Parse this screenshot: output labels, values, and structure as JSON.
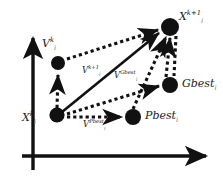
{
  "figure": {
    "background": "#ffffff",
    "ink": "#111111",
    "subscript_color": "#7a7a7a",
    "width": 223,
    "height": 182
  },
  "axes": {
    "x_axis": {
      "name": "horizontal-axis",
      "from": [
        22,
        156
      ],
      "to": [
        212,
        156
      ],
      "arrow": "right"
    },
    "y_axis": {
      "name": "vertical-axis",
      "from": [
        33,
        170
      ],
      "to": [
        33,
        32
      ],
      "arrow": "up"
    }
  },
  "nodes": [
    {
      "id": "Xk",
      "label_main": "X",
      "sup": "k",
      "sub": "i",
      "x": 57,
      "y": 115,
      "r": 7.5,
      "label_x": 24,
      "label_y": 113
    },
    {
      "id": "Vk",
      "label_main": "V",
      "sup": "k",
      "sub": "i",
      "x": 58,
      "y": 63,
      "r": 7.0,
      "label_x": 43,
      "label_y": 40
    },
    {
      "id": "Xk1",
      "label_main": "X",
      "sup": "k+1",
      "sub": "i",
      "x": 170,
      "y": 27,
      "r": 9.0,
      "label_x": 178,
      "label_y": 12
    },
    {
      "id": "Gbest",
      "label_main": "Gbest",
      "sup": "",
      "sub": "i",
      "x": 170,
      "y": 85,
      "r": 8.0,
      "label_x": 182,
      "label_y": 80
    },
    {
      "id": "Pbest",
      "label_main": "Pbest",
      "sup": "",
      "sub": "i",
      "x": 133,
      "y": 117,
      "r": 8.0,
      "label_x": 145,
      "label_y": 112
    }
  ],
  "vector_labels": [
    {
      "id": "v_k1",
      "main": "V",
      "sup": "k+1",
      "sub": "i",
      "x": 83,
      "y": 69
    },
    {
      "id": "v_gbest",
      "main": "V",
      "sup": "Gbest",
      "sub": "i",
      "x": 115,
      "y": 74
    },
    {
      "id": "v_pbest",
      "main": "V",
      "sup": "Pbest",
      "sub": "i",
      "x": 84,
      "y": 122
    }
  ],
  "edges": [
    {
      "id": "edge-xk-to-vk",
      "style": "dotted",
      "arrow": true,
      "from": "Xk",
      "to": "Vk"
    },
    {
      "id": "edge-vk-to-xk1",
      "style": "dotted",
      "arrow": true,
      "from": "Vk",
      "to": "Xk1"
    },
    {
      "id": "edge-xk-to-xk1",
      "style": "solid",
      "arrow": true,
      "from": "Xk",
      "to": "Xk1"
    },
    {
      "id": "edge-xk-to-pbest",
      "style": "dotted",
      "arrow": true,
      "from": "Xk",
      "to": "Pbest"
    },
    {
      "id": "edge-xk-to-gbest",
      "style": "dotted",
      "arrow": true,
      "from": "Xk",
      "to": "Gbest"
    },
    {
      "id": "edge-pbest-to-xk1",
      "style": "dotted",
      "arrow": true,
      "from": "Pbest",
      "to": "Xk1"
    },
    {
      "id": "edge-gbest-to-xk1",
      "style": "dotted",
      "arrow": true,
      "from": "Gbest",
      "to": "Xk1"
    },
    {
      "id": "edge-xk1-to-gbest",
      "style": "dotted",
      "arrow": false,
      "from": "Xk1",
      "to": "Gbest"
    }
  ]
}
